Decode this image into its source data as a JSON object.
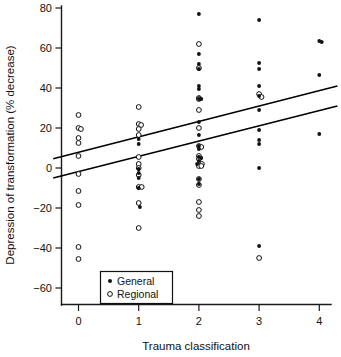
{
  "chart_data": {
    "type": "scatter",
    "title": "",
    "xlabel": "Trauma classification",
    "ylabel": "Depression of transformation (% decrease)",
    "xlim": [
      -0.42,
      4.3
    ],
    "ylim": [
      -68,
      84
    ],
    "xticks": [
      0,
      1,
      2,
      3,
      4
    ],
    "xticklabels": [
      "0",
      "1",
      "2",
      "3",
      "4"
    ],
    "yticks": [
      80,
      60,
      40,
      20,
      0,
      -20,
      -40,
      -60
    ],
    "yticklabels": [
      "80",
      "60",
      "40",
      "20",
      "0",
      "−20",
      "−40",
      "−60"
    ],
    "grid": false,
    "legend_position": "bottom-left-inside",
    "legend": [
      {
        "label": "General",
        "marker": "filled-circle"
      },
      {
        "label": "Regional",
        "marker": "open-circle"
      }
    ],
    "series": [
      {
        "name": "General",
        "marker": "filled-circle",
        "color": "#111111",
        "points": [
          {
            "x": 1.0,
            "y": 14.5
          },
          {
            "x": 1.0,
            "y": 12.0
          },
          {
            "x": 1.0,
            "y": -0.5
          },
          {
            "x": 1.0,
            "y": -2.5
          },
          {
            "x": 1.0,
            "y": -5.0
          },
          {
            "x": 1.0,
            "y": -10.0
          },
          {
            "x": 1.02,
            "y": -19.5
          },
          {
            "x": 2.0,
            "y": 77.0
          },
          {
            "x": 2.0,
            "y": 57.0
          },
          {
            "x": 2.0,
            "y": 52.0
          },
          {
            "x": 2.0,
            "y": 49.5
          },
          {
            "x": 2.0,
            "y": 41.0
          },
          {
            "x": 2.0,
            "y": 39.5
          },
          {
            "x": 2.0,
            "y": 34.5
          },
          {
            "x": 2.04,
            "y": 34.5
          },
          {
            "x": 2.0,
            "y": 23.0
          },
          {
            "x": 2.0,
            "y": 16.5
          },
          {
            "x": 2.0,
            "y": 11.0
          },
          {
            "x": 2.0,
            "y": 9.5
          },
          {
            "x": 2.0,
            "y": 5.5
          },
          {
            "x": 2.04,
            "y": 5.0
          },
          {
            "x": 2.0,
            "y": 3.5
          },
          {
            "x": 1.97,
            "y": 2.0
          },
          {
            "x": 2.0,
            "y": -5.5
          },
          {
            "x": 2.0,
            "y": -8.0
          },
          {
            "x": 3.0,
            "y": 74.0
          },
          {
            "x": 3.0,
            "y": 52.5
          },
          {
            "x": 3.0,
            "y": 49.5
          },
          {
            "x": 3.0,
            "y": 41.0
          },
          {
            "x": 3.0,
            "y": 36.0
          },
          {
            "x": 3.0,
            "y": 29.0
          },
          {
            "x": 3.0,
            "y": 19.0
          },
          {
            "x": 3.0,
            "y": 14.0
          },
          {
            "x": 3.0,
            "y": 12.0
          },
          {
            "x": 3.0,
            "y": 0.0
          },
          {
            "x": 3.0,
            "y": -39.0
          },
          {
            "x": 4.0,
            "y": 63.5
          },
          {
            "x": 4.04,
            "y": 63.0
          },
          {
            "x": 4.0,
            "y": 46.5
          },
          {
            "x": 4.0,
            "y": 17.0
          }
        ]
      },
      {
        "name": "Regional",
        "marker": "open-circle",
        "color": "#111111",
        "points": [
          {
            "x": 0.0,
            "y": 26.5
          },
          {
            "x": 0.0,
            "y": 20.0
          },
          {
            "x": 0.04,
            "y": 19.5
          },
          {
            "x": 0.0,
            "y": 15.0
          },
          {
            "x": 0.0,
            "y": 12.5
          },
          {
            "x": 0.0,
            "y": 6.0
          },
          {
            "x": 0.0,
            "y": -3.0
          },
          {
            "x": 0.0,
            "y": -11.5
          },
          {
            "x": 0.0,
            "y": -18.5
          },
          {
            "x": 0.0,
            "y": -39.5
          },
          {
            "x": 0.0,
            "y": -45.5
          },
          {
            "x": 1.0,
            "y": 30.5
          },
          {
            "x": 1.0,
            "y": 22.0
          },
          {
            "x": 1.04,
            "y": 21.5
          },
          {
            "x": 1.0,
            "y": 19.5
          },
          {
            "x": 1.0,
            "y": 16.5
          },
          {
            "x": 1.0,
            "y": 5.5
          },
          {
            "x": 1.0,
            "y": 2.0
          },
          {
            "x": 1.0,
            "y": 0.0
          },
          {
            "x": 1.0,
            "y": -3.5
          },
          {
            "x": 1.0,
            "y": -9.5
          },
          {
            "x": 1.05,
            "y": -9.5
          },
          {
            "x": 1.0,
            "y": -17.5
          },
          {
            "x": 1.0,
            "y": -30.0
          },
          {
            "x": 2.0,
            "y": 62.0
          },
          {
            "x": 2.0,
            "y": 50.0
          },
          {
            "x": 2.0,
            "y": 35.0
          },
          {
            "x": 2.0,
            "y": 34.5
          },
          {
            "x": 2.0,
            "y": 29.0
          },
          {
            "x": 2.0,
            "y": 20.0
          },
          {
            "x": 2.0,
            "y": 11.0
          },
          {
            "x": 2.04,
            "y": 10.5
          },
          {
            "x": 2.0,
            "y": 6.0
          },
          {
            "x": 2.0,
            "y": 4.5
          },
          {
            "x": 2.05,
            "y": 2.0
          },
          {
            "x": 2.0,
            "y": 1.0
          },
          {
            "x": 2.04,
            "y": 1.0
          },
          {
            "x": 2.0,
            "y": -5.5
          },
          {
            "x": 2.0,
            "y": -8.5
          },
          {
            "x": 2.0,
            "y": -17.0
          },
          {
            "x": 2.0,
            "y": -21.0
          },
          {
            "x": 2.0,
            "y": -24.0
          },
          {
            "x": 3.0,
            "y": 37.0
          },
          {
            "x": 3.04,
            "y": 35.5
          },
          {
            "x": 3.0,
            "y": -45.0
          }
        ]
      }
    ],
    "fit_lines": [
      {
        "name": "general-fit",
        "x0": -0.42,
        "y0": 4.6,
        "x1": 4.3,
        "y1": 41.0
      },
      {
        "name": "regional-fit",
        "x0": -0.42,
        "y0": -5.0,
        "x1": 4.3,
        "y1": 31.0
      }
    ]
  }
}
